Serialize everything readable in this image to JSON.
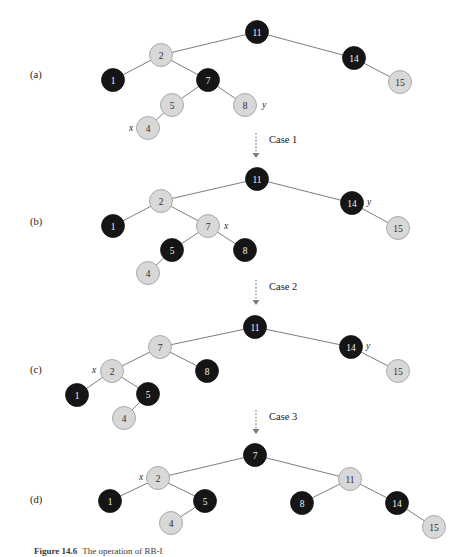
{
  "figure": {
    "caption_label": "Figure 14.6",
    "caption_text": "The operation of RB-I",
    "background_color": "#ffffff",
    "black_node_color": "#151515",
    "gray_node_color": "#d8d8d8",
    "edge_color": "#5d5d5d"
  },
  "panels": [
    {
      "id": "panel-a",
      "label": "(a)",
      "label_x": 30,
      "label_y": 78,
      "nodes": [
        {
          "key": "11",
          "x": 257,
          "y": 32,
          "r": 11.5,
          "color": "black"
        },
        {
          "key": "2",
          "x": 161,
          "y": 55,
          "r": 11.5,
          "color": "gray"
        },
        {
          "key": "14",
          "x": 354,
          "y": 58,
          "r": 11.5,
          "color": "black"
        },
        {
          "key": "1",
          "x": 113,
          "y": 80,
          "r": 11.5,
          "color": "black"
        },
        {
          "key": "7",
          "x": 208,
          "y": 80,
          "r": 11.5,
          "color": "black"
        },
        {
          "key": "15",
          "x": 400,
          "y": 82,
          "r": 11.5,
          "color": "gray"
        },
        {
          "key": "5",
          "x": 172,
          "y": 105,
          "r": 11.5,
          "color": "gray"
        },
        {
          "key": "8",
          "x": 245,
          "y": 105,
          "r": 11.5,
          "color": "gray"
        },
        {
          "key": "4",
          "x": 148,
          "y": 128,
          "r": 11.5,
          "color": "gray"
        }
      ],
      "edges": [
        [
          161,
          55,
          257,
          32
        ],
        [
          257,
          32,
          354,
          58
        ],
        [
          113,
          80,
          161,
          55
        ],
        [
          161,
          55,
          208,
          80
        ],
        [
          354,
          58,
          400,
          82
        ],
        [
          172,
          105,
          208,
          80
        ],
        [
          208,
          80,
          245,
          105
        ],
        [
          148,
          128,
          172,
          105
        ]
      ],
      "pointers": [
        {
          "text": "x",
          "x": 129,
          "y": 131
        },
        {
          "text": "y",
          "x": 262,
          "y": 108
        }
      ]
    },
    {
      "id": "panel-b",
      "label": "(b)",
      "label_x": 30,
      "label_y": 225,
      "nodes": [
        {
          "key": "11",
          "x": 257,
          "y": 179,
          "r": 11.5,
          "color": "black"
        },
        {
          "key": "2",
          "x": 161,
          "y": 201,
          "r": 11.5,
          "color": "gray"
        },
        {
          "key": "14",
          "x": 352,
          "y": 203,
          "r": 11.5,
          "color": "black"
        },
        {
          "key": "1",
          "x": 113,
          "y": 226,
          "r": 11.5,
          "color": "black"
        },
        {
          "key": "7",
          "x": 208,
          "y": 226,
          "r": 11.5,
          "color": "gray"
        },
        {
          "key": "15",
          "x": 398,
          "y": 228,
          "r": 11.5,
          "color": "gray"
        },
        {
          "key": "5",
          "x": 172,
          "y": 250,
          "r": 11.5,
          "color": "black"
        },
        {
          "key": "8",
          "x": 245,
          "y": 250,
          "r": 11.5,
          "color": "black"
        },
        {
          "key": "4",
          "x": 148,
          "y": 273,
          "r": 11.5,
          "color": "gray"
        }
      ],
      "edges": [
        [
          161,
          201,
          257,
          179
        ],
        [
          257,
          179,
          352,
          203
        ],
        [
          113,
          226,
          161,
          201
        ],
        [
          161,
          201,
          208,
          226
        ],
        [
          352,
          203,
          398,
          228
        ],
        [
          172,
          250,
          208,
          226
        ],
        [
          208,
          226,
          245,
          250
        ],
        [
          148,
          273,
          172,
          250
        ]
      ],
      "pointers": [
        {
          "text": "x",
          "x": 224,
          "y": 229
        },
        {
          "text": "y",
          "x": 367,
          "y": 205
        }
      ]
    },
    {
      "id": "panel-c",
      "label": "(c)",
      "label_x": 30,
      "label_y": 373,
      "nodes": [
        {
          "key": "11",
          "x": 255,
          "y": 327,
          "r": 11.5,
          "color": "black"
        },
        {
          "key": "7",
          "x": 160,
          "y": 347,
          "r": 11.5,
          "color": "gray"
        },
        {
          "key": "14",
          "x": 351,
          "y": 347,
          "r": 11.5,
          "color": "black"
        },
        {
          "key": "2",
          "x": 112,
          "y": 371,
          "r": 11.5,
          "color": "gray"
        },
        {
          "key": "8",
          "x": 207,
          "y": 371,
          "r": 11.5,
          "color": "black"
        },
        {
          "key": "15",
          "x": 398,
          "y": 371,
          "r": 11.5,
          "color": "gray"
        },
        {
          "key": "1",
          "x": 77,
          "y": 395,
          "r": 11.5,
          "color": "black"
        },
        {
          "key": "5",
          "x": 148,
          "y": 394,
          "r": 11.5,
          "color": "black"
        },
        {
          "key": "4",
          "x": 124,
          "y": 418,
          "r": 11.5,
          "color": "gray"
        }
      ],
      "edges": [
        [
          160,
          347,
          255,
          327
        ],
        [
          255,
          327,
          351,
          347
        ],
        [
          112,
          371,
          160,
          347
        ],
        [
          160,
          347,
          207,
          371
        ],
        [
          351,
          347,
          398,
          371
        ],
        [
          77,
          395,
          112,
          371
        ],
        [
          112,
          371,
          148,
          394
        ],
        [
          124,
          418,
          148,
          394
        ]
      ],
      "pointers": [
        {
          "text": "x",
          "x": 92,
          "y": 373
        },
        {
          "text": "y",
          "x": 366,
          "y": 349
        }
      ]
    },
    {
      "id": "panel-d",
      "label": "(d)",
      "label_x": 30,
      "label_y": 503,
      "nodes": [
        {
          "key": "7",
          "x": 255,
          "y": 455,
          "r": 11.5,
          "color": "black"
        },
        {
          "key": "2",
          "x": 158,
          "y": 478,
          "r": 11.5,
          "color": "gray"
        },
        {
          "key": "11",
          "x": 350,
          "y": 479,
          "r": 11.5,
          "color": "gray"
        },
        {
          "key": "1",
          "x": 110,
          "y": 501,
          "r": 11.5,
          "color": "black"
        },
        {
          "key": "5",
          "x": 205,
          "y": 501,
          "r": 11.5,
          "color": "black"
        },
        {
          "key": "8",
          "x": 302,
          "y": 503,
          "r": 11.5,
          "color": "black"
        },
        {
          "key": "14",
          "x": 397,
          "y": 503,
          "r": 11.5,
          "color": "black"
        },
        {
          "key": "4",
          "x": 171,
          "y": 523,
          "r": 11.5,
          "color": "gray"
        },
        {
          "key": "15",
          "x": 434,
          "y": 527,
          "r": 11.5,
          "color": "gray"
        }
      ],
      "edges": [
        [
          158,
          478,
          255,
          455
        ],
        [
          255,
          455,
          350,
          479
        ],
        [
          110,
          501,
          158,
          478
        ],
        [
          158,
          478,
          205,
          501
        ],
        [
          302,
          503,
          350,
          479
        ],
        [
          350,
          479,
          397,
          503
        ],
        [
          171,
          523,
          205,
          501
        ],
        [
          397,
          503,
          434,
          527
        ]
      ],
      "pointers": [
        {
          "text": "x",
          "x": 139,
          "y": 480
        }
      ]
    }
  ],
  "transitions": [
    {
      "id": "case-1",
      "label": "Case 1",
      "x": 256,
      "y_top": 133,
      "y_bottom": 158,
      "text_x": 269,
      "text_y": 143
    },
    {
      "id": "case-2",
      "label": "Case 2",
      "x": 256,
      "y_top": 280,
      "y_bottom": 305,
      "text_x": 269,
      "text_y": 290
    },
    {
      "id": "case-3",
      "label": "Case 3",
      "x": 256,
      "y_top": 410,
      "y_bottom": 434,
      "text_x": 269,
      "text_y": 420
    }
  ]
}
